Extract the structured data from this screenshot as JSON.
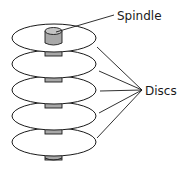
{
  "diagram": {
    "type": "labeled illustration",
    "labels": {
      "spindle": "Spindle",
      "discs": "Discs"
    },
    "disc_count": 5,
    "colors": {
      "stroke": "#1a1a1a",
      "disc_fill": "#ffffff",
      "spindle_fill": "#a8a8a8",
      "spindle_top": "#c4c4c4"
    }
  }
}
